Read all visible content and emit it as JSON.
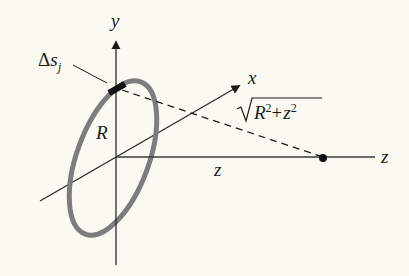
{
  "diagram": {
    "title": "",
    "labels": {
      "y_axis": "y",
      "x_axis": "x",
      "z_axis": "z",
      "z_distance": "z",
      "radius": "R",
      "segment_delta": "Δ",
      "segment_s": "s",
      "segment_sub": "j",
      "distance_R": "R",
      "distance_z": "z",
      "distance_exp": "2",
      "distance_plus": "+"
    },
    "colors": {
      "background": "#fbfaf2",
      "axis": "#2a2a2a",
      "ring": "#7d7d7d",
      "segment": "#111111",
      "point": "#111111"
    },
    "elements": [
      "y-axis with arrow",
      "x-axis with arrow",
      "z-axis",
      "gray ring of radius R in xy-plane",
      "charge segment Δs_j on ring",
      "dashed line from segment to point on z-axis",
      "point on z-axis at distance z"
    ]
  }
}
